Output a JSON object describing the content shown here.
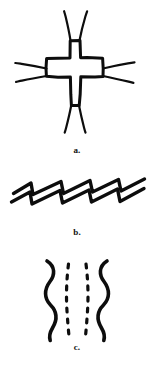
{
  "plate": {
    "background_color": "#ffffff",
    "ink_color": "#0d0d0d",
    "figure_count": 3
  },
  "figures": [
    {
      "id": "a",
      "caption": "a.",
      "name": "cross-with-splayed-rays",
      "description": "Outlined Greek cross with two splayed line rays at each of the four arm tips",
      "ray_groups": 4,
      "rays_per_group": 2
    },
    {
      "id": "b",
      "caption": "b.",
      "name": "paired-sawtooth-zigzag",
      "description": "Two parallel heavy sawtooth zigzag lines descending from left to right",
      "lines": 2,
      "teeth_per_line": 4
    },
    {
      "id": "c",
      "caption": "c.",
      "name": "wavy-lines-with-dashed-pair",
      "description": "Two mirrored solid wavy vertical lines flanking two dashed vertical lines",
      "solid_lines": 2,
      "dashed_lines": 2,
      "dashes_per_line": 7
    }
  ]
}
